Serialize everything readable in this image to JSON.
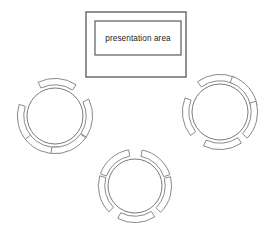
{
  "diagram": {
    "type": "floor-plan",
    "canvas": {
      "width": 276,
      "height": 240
    },
    "background_color": "#ffffff",
    "line_color": "#6e6e6e",
    "text_color": "#1a1a1a"
  },
  "presentation_area": {
    "label": "presentation area",
    "outer_rect": {
      "x": 86,
      "y": 12,
      "width": 100,
      "height": 65
    },
    "inner_rect": {
      "x": 95,
      "y": 21,
      "width": 86,
      "height": 34
    }
  },
  "tables": [
    {
      "name": "table-left",
      "cx": 55,
      "cy": 116,
      "r": 28,
      "seat_count": 5,
      "seat_angles": [
        -86,
        168,
        4,
        112,
        66
      ]
    },
    {
      "name": "table-right",
      "cx": 220,
      "cy": 112,
      "r": 28,
      "seat_count": 5,
      "seat_angles": [
        -96,
        -40,
        172,
        14,
        86
      ]
    },
    {
      "name": "table-bottom",
      "cx": 135,
      "cy": 186,
      "r": 27,
      "seat_count": 5,
      "seat_angles": [
        -130,
        -48,
        166,
        16,
        88
      ]
    }
  ],
  "legend": {
    "chair_shape": "horseshoe-arc",
    "table_shape": "circle"
  }
}
